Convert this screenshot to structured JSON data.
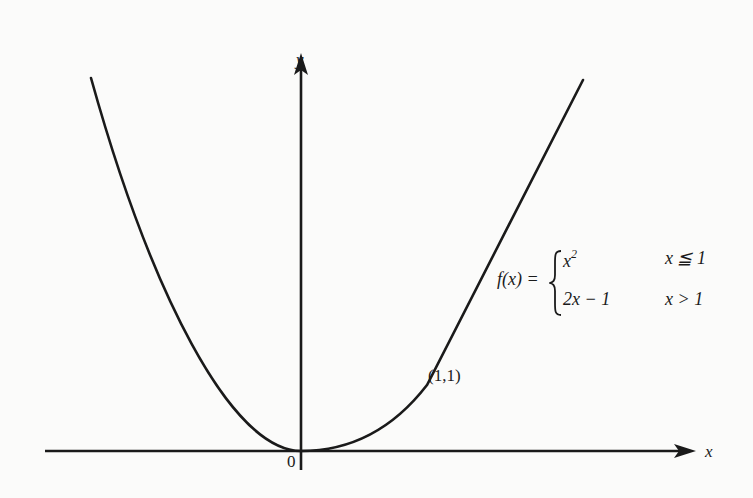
{
  "figure": {
    "axes": {
      "x_label": "x",
      "y_label": "y",
      "origin_label": "0"
    },
    "point": {
      "label": "(1,1)"
    },
    "function_definition": {
      "lhs": "f(x) =",
      "cases": [
        {
          "expression": "x",
          "exponent": "2",
          "condition": "x ≦ 1"
        },
        {
          "expression": "2x − 1",
          "exponent": "",
          "condition": "x > 1"
        }
      ]
    },
    "colors": {
      "stroke": "#1a1a1a",
      "background": "#fbfbfa"
    }
  }
}
